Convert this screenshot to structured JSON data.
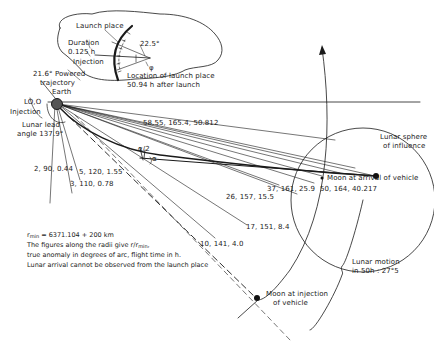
{
  "diagram": {
    "inset": {
      "launch_place": "Launch place",
      "duration_line1": "Duration",
      "duration_line2": "0.125 h",
      "injection": "Injection",
      "angle": "22.5°",
      "phi": "φ",
      "location_line1": "Location of launch place",
      "location_line2": "50.94 h after launch"
    },
    "earth": {
      "label": "Earth",
      "powered_line1": "21.6° Powered",
      "powered_line2": "trajectory",
      "lo_label": "LO,O",
      "injection_label": "Injection",
      "lead_line1": "Lunar lead",
      "lead_line2": "angle 137.9°"
    },
    "radii": [
      {
        "label": "2, 90, 0.44"
      },
      {
        "label": "3, 110, 0.78"
      },
      {
        "label": "5, 120, 1.55"
      },
      {
        "label": "10, 141, 4.0"
      },
      {
        "label": "17, 151, 8.4"
      },
      {
        "label": "26, 157, 15.5"
      },
      {
        "label": "37, 161, 25.9"
      },
      {
        "label": "50, 164, 40.217"
      },
      {
        "label": "58.55, 165.4, 50.812"
      }
    ],
    "angles": {
      "half_alpha": "α/2",
      "alpha": "α"
    },
    "moon": {
      "sphere_line1": "Lunar sphere",
      "sphere_line2": "of influence",
      "arrival": "Moon at arrival of vehicle",
      "injection_line1": "Moon at injection",
      "injection_line2": "of vehicle",
      "motion_line1": "Lunar motion",
      "motion_line2": "in 50h : 27°5"
    },
    "notes": {
      "rmin": "r",
      "rmin_sub": "min",
      "rmin_value": " = 6371.104  + 200 km",
      "line2_pre": "The figures along the radii give r/r",
      "line2_sub": "min",
      "line2_post": ",",
      "line3": "true anomaly in degrees of arc, flight time in h.",
      "line4": "Lunar arrival cannot be observed from the launch place"
    }
  }
}
